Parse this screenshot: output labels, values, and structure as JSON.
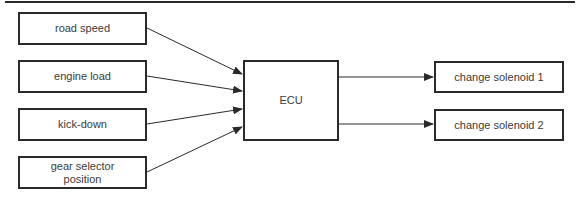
{
  "diagram": {
    "inputs": [
      {
        "id": "road-speed",
        "label": "road speed"
      },
      {
        "id": "engine-load",
        "label": "engine load"
      },
      {
        "id": "kick-down",
        "label": "kick-down"
      },
      {
        "id": "gear-selector-position",
        "label": "gear selector position",
        "lines": [
          "gear selector",
          "position"
        ]
      }
    ],
    "controller": {
      "id": "ecu",
      "label": "ECU"
    },
    "outputs": [
      {
        "id": "change-solenoid-1",
        "label": "change solenoid 1"
      },
      {
        "id": "change-solenoid-2",
        "label": "change solenoid 2"
      }
    ],
    "edges": [
      {
        "from": "road speed",
        "to": "ECU"
      },
      {
        "from": "engine load",
        "to": "ECU"
      },
      {
        "from": "kick-down",
        "to": "ECU"
      },
      {
        "from": "gear selector position",
        "to": "ECU"
      },
      {
        "from": "ECU",
        "to": "change solenoid 1"
      },
      {
        "from": "ECU",
        "to": "change solenoid 2"
      }
    ],
    "colors": {
      "line": "#2a2a2a",
      "text": "#3a3a3a",
      "background": "#ffffff"
    }
  }
}
